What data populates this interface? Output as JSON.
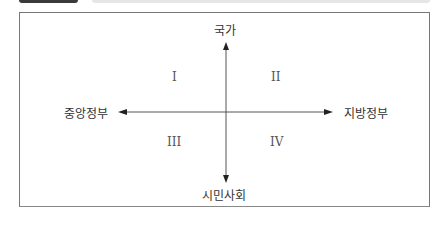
{
  "axes": {
    "top": "국가",
    "bottom": "시민사회",
    "left": "중앙정부",
    "right": "지방정부"
  },
  "quadrants": [
    "I",
    "II",
    "III",
    "IV"
  ],
  "colors": {
    "axis": "#555555",
    "frame": "#777777",
    "text": "#333333"
  }
}
